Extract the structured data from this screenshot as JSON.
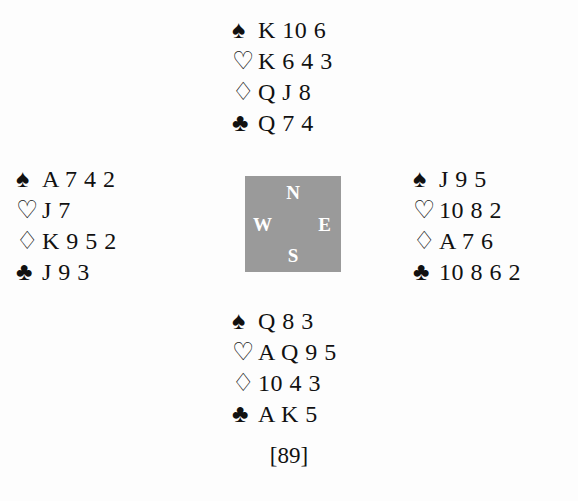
{
  "diagram": {
    "type": "bridge-hand-deal",
    "caption": "[89]",
    "background_color": "#fdfdfd",
    "text_color": "#111111"
  },
  "suits": {
    "spade": {
      "symbol": "♠",
      "name": "spade-symbol"
    },
    "heart": {
      "symbol": "♡",
      "name": "heart-symbol"
    },
    "diamond": {
      "symbol": "♢",
      "name": "diamond-symbol"
    },
    "club": {
      "symbol": "♣",
      "name": "club-symbol"
    }
  },
  "compass": {
    "background_color": "#9a9a9a",
    "label_color": "#ffffff",
    "north": "N",
    "west": "W",
    "east": "E",
    "south": "S"
  },
  "hands": {
    "north": {
      "position": "North",
      "spades": "K 10 6",
      "hearts": "K 6 4 3",
      "diamonds": "Q J 8",
      "clubs": "Q 7 4"
    },
    "west": {
      "position": "West",
      "spades": "A 7 4 2",
      "hearts": "J 7",
      "diamonds": "K 9 5 2",
      "clubs": "J 9 3"
    },
    "east": {
      "position": "East",
      "spades": "J 9 5",
      "hearts": "10 8 2",
      "diamonds": "A 7 6",
      "clubs": "10 8 6 2"
    },
    "south": {
      "position": "South",
      "spades": "Q 8 3",
      "hearts": "A Q 9 5",
      "diamonds": "10 4 3",
      "clubs": "A K 5"
    }
  }
}
